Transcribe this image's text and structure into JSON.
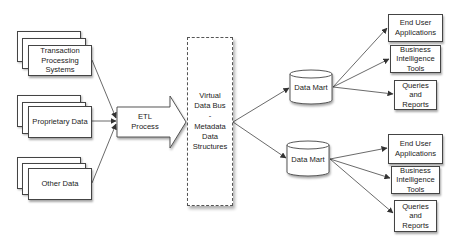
{
  "sources": [
    {
      "id": "tps",
      "label": "Transaction\nProcessing\nSystems"
    },
    {
      "id": "proprietary",
      "label": "Proprietary Data"
    },
    {
      "id": "other",
      "label": "Other Data"
    }
  ],
  "etl": {
    "label": "ETL\nProcess"
  },
  "bus": {
    "label": "Virtual\nData Bus\n-\nMetadata\nData\nStructures"
  },
  "data_marts": [
    {
      "label": "Data Mart"
    },
    {
      "label": "Data Mart"
    }
  ],
  "outputs_top": [
    {
      "label": "End User\nApplications"
    },
    {
      "label": "Business\nIntelligence\nTools"
    },
    {
      "label": "Queries\nand\nReports"
    }
  ],
  "outputs_bottom": [
    {
      "label": "End User\nApplications"
    },
    {
      "label": "Business\nIntelligence\nTools"
    },
    {
      "label": "Queries\nand\nReports"
    }
  ],
  "colors": {
    "stroke": "#444444",
    "background": "#ffffff"
  }
}
